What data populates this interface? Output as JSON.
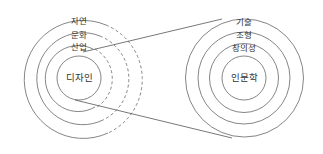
{
  "diagram": {
    "left": {
      "center_label": "디자인",
      "rings": [
        "산업",
        "문화",
        "자연"
      ],
      "cx": 79,
      "cy": 78,
      "radii": [
        22,
        35,
        47,
        60
      ]
    },
    "right": {
      "center_label": "인문학",
      "rings": [
        "창의성",
        "조형",
        "기술"
      ],
      "cx": 244,
      "cy": 78,
      "radii": [
        22,
        34,
        46,
        59
      ]
    },
    "colors": {
      "stroke": "#555555",
      "text": "#333333"
    }
  }
}
